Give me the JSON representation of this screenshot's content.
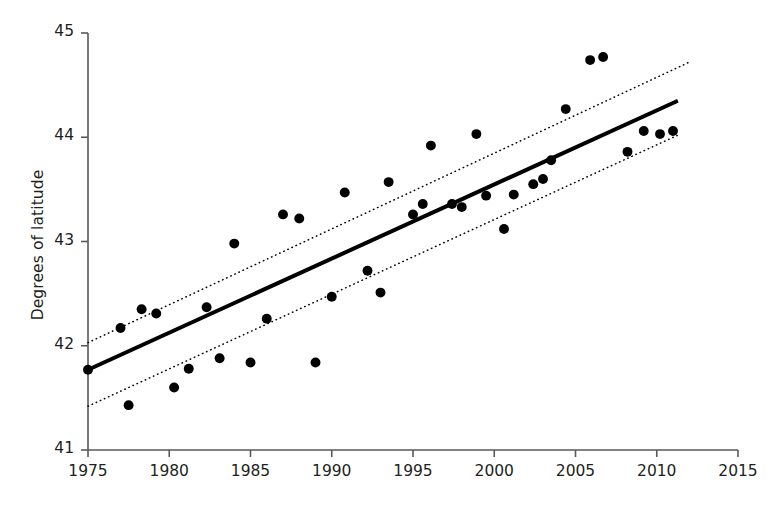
{
  "chart_data": {
    "type": "scatter",
    "title": "",
    "xlabel": "",
    "ylabel": "Degrees of latitude",
    "xlim": [
      1975,
      2015
    ],
    "ylim": [
      41,
      45
    ],
    "xticks": [
      1975,
      1980,
      1985,
      1990,
      1995,
      2000,
      2005,
      2010,
      2015
    ],
    "xtick_labels": [
      "1975",
      "1980",
      "1985",
      "1990",
      "1995",
      "2000",
      "2005",
      "2010",
      "2015"
    ],
    "yticks": [
      41,
      42,
      43,
      44,
      45
    ],
    "ytick_labels": [
      "41",
      "42",
      "43",
      "44",
      "45"
    ],
    "grid": false,
    "legend": null,
    "marker": {
      "shape": "circle",
      "color": "#000000",
      "size": 7.5
    },
    "points": [
      {
        "x": 1975.0,
        "y": 41.77
      },
      {
        "x": 1977.0,
        "y": 42.17
      },
      {
        "x": 1977.5,
        "y": 41.43
      },
      {
        "x": 1978.3,
        "y": 42.35
      },
      {
        "x": 1979.2,
        "y": 42.31
      },
      {
        "x": 1980.3,
        "y": 41.6
      },
      {
        "x": 1981.2,
        "y": 41.78
      },
      {
        "x": 1982.3,
        "y": 42.37
      },
      {
        "x": 1983.1,
        "y": 41.88
      },
      {
        "x": 1984.0,
        "y": 42.98
      },
      {
        "x": 1985.0,
        "y": 41.84
      },
      {
        "x": 1986.0,
        "y": 42.26
      },
      {
        "x": 1987.0,
        "y": 43.26
      },
      {
        "x": 1988.0,
        "y": 43.22
      },
      {
        "x": 1989.0,
        "y": 41.84
      },
      {
        "x": 1990.0,
        "y": 42.47
      },
      {
        "x": 1990.8,
        "y": 43.47
      },
      {
        "x": 1992.2,
        "y": 42.72
      },
      {
        "x": 1993.0,
        "y": 42.51
      },
      {
        "x": 1993.5,
        "y": 43.57
      },
      {
        "x": 1995.0,
        "y": 43.26
      },
      {
        "x": 1995.6,
        "y": 43.36
      },
      {
        "x": 1996.1,
        "y": 43.92
      },
      {
        "x": 1997.4,
        "y": 43.36
      },
      {
        "x": 1998.0,
        "y": 43.33
      },
      {
        "x": 1998.9,
        "y": 44.03
      },
      {
        "x": 1999.5,
        "y": 43.44
      },
      {
        "x": 2000.6,
        "y": 43.12
      },
      {
        "x": 2001.2,
        "y": 43.45
      },
      {
        "x": 2002.4,
        "y": 43.55
      },
      {
        "x": 2003.0,
        "y": 43.6
      },
      {
        "x": 2003.5,
        "y": 43.78
      },
      {
        "x": 2004.4,
        "y": 44.27
      },
      {
        "x": 2005.9,
        "y": 44.74
      },
      {
        "x": 2006.7,
        "y": 44.77
      },
      {
        "x": 2008.2,
        "y": 43.86
      },
      {
        "x": 2009.2,
        "y": 44.06
      },
      {
        "x": 2010.2,
        "y": 44.03
      },
      {
        "x": 2011.0,
        "y": 44.06
      }
    ],
    "fit_line": {
      "style": "solid",
      "color": "#000000",
      "width": 4,
      "x": [
        1975,
        2011.3
      ],
      "y": [
        41.77,
        44.35
      ]
    },
    "confidence_bands": [
      {
        "name": "upper",
        "style": "dotted",
        "color": "#000000",
        "width": 1.5,
        "x": [
          1975,
          2012
        ],
        "y": [
          42.03,
          44.72
        ]
      },
      {
        "name": "lower",
        "style": "dotted",
        "color": "#000000",
        "width": 1.5,
        "x": [
          1975,
          2011.3
        ],
        "y": [
          41.42,
          44.02
        ]
      }
    ]
  },
  "axis_style": {
    "spine_color": "#58595b",
    "tick_color": "#58595b",
    "left_spine": true,
    "bottom_spine": true,
    "top_spine": false,
    "right_spine": false
  },
  "caption": ""
}
